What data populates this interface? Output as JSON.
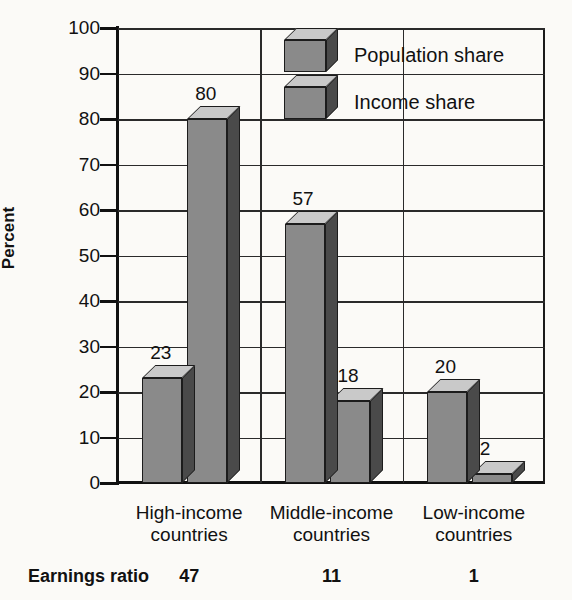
{
  "chart_data": {
    "type": "bar",
    "title": "",
    "subtitle": "",
    "xlabel": "",
    "ylabel": "Percent",
    "ylim": [
      0,
      100
    ],
    "ytick_labels": [
      "100",
      "90",
      "80",
      "70",
      "60",
      "50",
      "40",
      "30",
      "20",
      "10",
      "0"
    ],
    "ytick_values": [
      100,
      90,
      80,
      70,
      60,
      50,
      40,
      30,
      20,
      10,
      0
    ],
    "grid": "both",
    "legend_position": "top-center",
    "categories": [
      "High-income countries",
      "Middle-income countries",
      "Low-income countries"
    ],
    "category_lines": [
      [
        "High-income",
        "countries"
      ],
      [
        "Middle-income",
        "countries"
      ],
      [
        "Low-income",
        "countries"
      ]
    ],
    "series": [
      {
        "name": "Population share",
        "values": [
          23,
          57,
          20
        ],
        "color": "#8a8a8a"
      },
      {
        "name": "Income share",
        "values": [
          80,
          18,
          2
        ],
        "color": "#8a8a8a"
      }
    ],
    "annotations": {
      "footer_label": "Earnings ratio",
      "footer_values": [
        "47",
        "11",
        "1"
      ]
    }
  },
  "colors": {
    "background": "#fbfaf7",
    "bar_front": "#8a8a8a",
    "bar_top": "#c9c9c9",
    "bar_side": "#4a4a4a",
    "axis": "#111111",
    "grid": "#2a2a2a",
    "text": "#111111"
  }
}
